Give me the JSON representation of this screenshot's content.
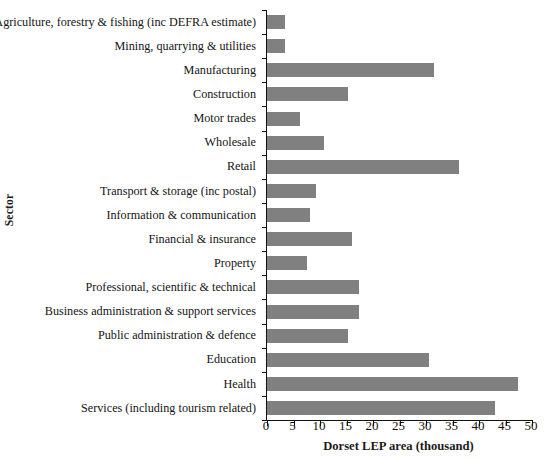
{
  "chart_data": {
    "type": "bar",
    "orientation": "horizontal",
    "title": "",
    "xlabel": "Dorset LEP area (thousand)",
    "ylabel": "Sector",
    "xlim": [
      0,
      50
    ],
    "xticks": [
      0,
      5,
      10,
      15,
      20,
      25,
      30,
      35,
      40,
      45,
      50
    ],
    "grid": false,
    "legend": null,
    "bar_color": "#808080",
    "axis_color": "#111111",
    "categories": [
      "Agriculture, forestry & fishing (inc DEFRA estimate)",
      "Mining, quarrying & utilities",
      "Manufacturing",
      "Construction",
      "Motor trades",
      "Wholesale",
      "Retail",
      "Transport & storage (inc postal)",
      "Information & communication",
      "Financial & insurance",
      "Property",
      "Professional, scientific & technical",
      "Business administration & support services",
      "Public administration & defence",
      "Education",
      "Health",
      "Services (including tourism related)"
    ],
    "values": [
      3.4,
      3.4,
      31.5,
      15.3,
      6.2,
      10.7,
      36.2,
      9.2,
      8.1,
      16.0,
      7.5,
      17.4,
      17.4,
      15.3,
      30.6,
      47.4,
      43.0
    ]
  }
}
